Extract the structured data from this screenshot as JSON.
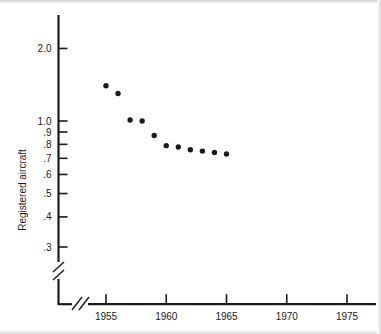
{
  "chart_data": {
    "type": "scatter",
    "title": "",
    "xlabel": "",
    "ylabel": "Registered aircraft",
    "x": [
      1955,
      1956,
      1957,
      1958,
      1959,
      1960,
      1961,
      1962,
      1963,
      1964,
      1965
    ],
    "values": [
      1.4,
      1.3,
      1.01,
      1.0,
      0.87,
      0.79,
      0.78,
      0.76,
      0.75,
      0.74,
      0.73
    ],
    "series": [
      {
        "name": "Registered aircraft",
        "values": [
          1.4,
          1.3,
          1.01,
          1.0,
          0.87,
          0.79,
          0.78,
          0.76,
          0.75,
          0.74,
          0.73
        ]
      }
    ],
    "xlim": [
      1953,
      1977
    ],
    "ylim": [
      0.28,
      2.3
    ],
    "yscale": "log",
    "xscale": "linear",
    "grid": false,
    "legend": false,
    "legend_position": "none",
    "x_tick_labels": [
      "1955",
      "1960",
      "1965",
      "1970",
      "1975"
    ],
    "x_tick_values": [
      1955,
      1960,
      1965,
      1970,
      1975
    ],
    "y_tick_labels": [
      "2.0",
      "1.0",
      ".9",
      ".8",
      ".7",
      ".6",
      ".5",
      ".4",
      ".3"
    ],
    "y_tick_values": [
      2.0,
      1.0,
      0.9,
      0.8,
      0.7,
      0.6,
      0.5,
      0.4,
      0.3
    ],
    "axis_break_x": true,
    "axis_break_y": true,
    "marker": "filled-circle",
    "marker_color": "#1a1a1a",
    "axis_color": "#1a1a1a",
    "background_color": "#ffffff",
    "annotations": []
  },
  "figure": {
    "y_axis_title": "Registered aircraft",
    "x_axis_title": "",
    "caption": ""
  },
  "colors": {
    "ink": "#1a1a1a",
    "paper": "#ffffff",
    "page_edge": "#d4d4d4"
  }
}
